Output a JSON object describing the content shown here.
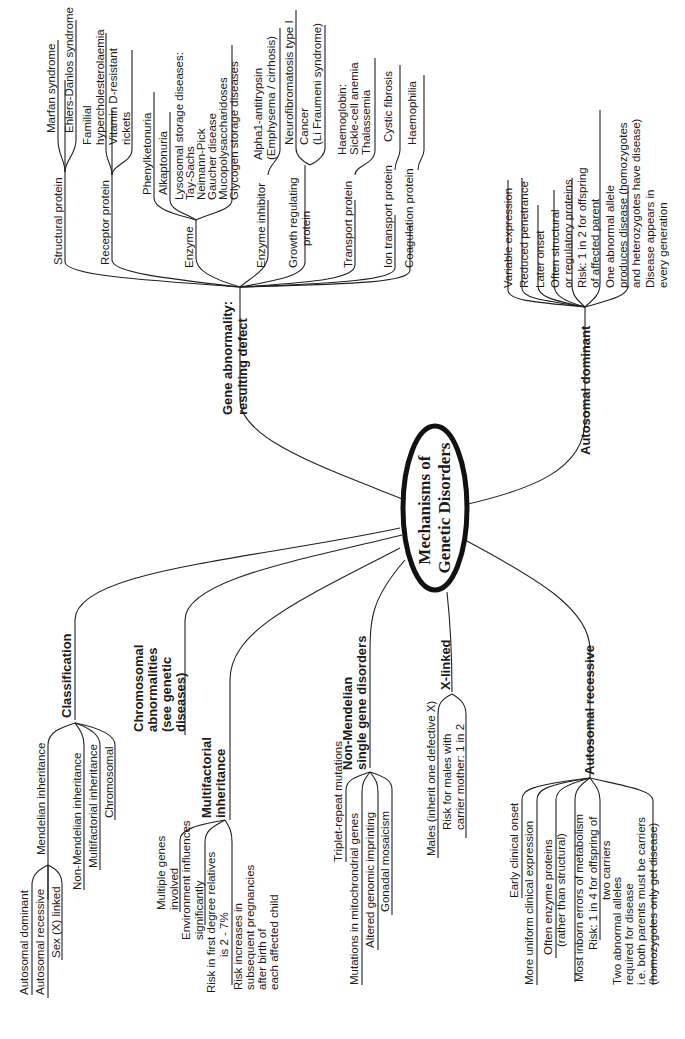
{
  "center": {
    "lines": [
      "Mechanisms of",
      "Genetic Disorders"
    ]
  },
  "branches": {
    "gene_abnormality": {
      "title": [
        "Gene abnormality:",
        "resulting defect"
      ],
      "children": [
        {
          "label": [
            "Structural protein"
          ],
          "items": [
            [
              "Marfan syndrome"
            ],
            [
              "Ehlers-Danlos syndrome"
            ]
          ]
        },
        {
          "label": [
            "Receptor protein"
          ],
          "items": [
            [
              "Familial",
              "hypercholesterolaemia"
            ],
            [
              "Vitamin D-resistant",
              "rickets"
            ]
          ]
        },
        {
          "label": [
            "Enzyme"
          ],
          "items": [
            [
              "Phenylketonuria"
            ],
            [
              "Alkaptonuria"
            ],
            [
              "Lysosomal storage diseases:",
              "Tay-Sachs",
              "Neimann-Pick",
              "Gaucher disease",
              "Mucopolysaccharidoses",
              "Glycogen storage diseases"
            ]
          ]
        },
        {
          "label": [
            "Enzyme inhibitor"
          ],
          "items": [
            [
              "Alpha1-antitrypsin",
              "(Emphysema / cirrhosis)"
            ]
          ]
        },
        {
          "label": [
            "Growth regulating",
            "protein"
          ],
          "items": [
            [
              "Neurofibromatosis type I"
            ],
            [
              "Cancer",
              "(Li Fraumeni syndrome)"
            ]
          ]
        },
        {
          "label": [
            "Transport protein"
          ],
          "items": [
            [
              "Haemoglobin:",
              "Sickle-cell anemia",
              "Thalassemia"
            ]
          ]
        },
        {
          "label": [
            "Ion transport protein"
          ],
          "items": [
            [
              "Cystic fibrosis"
            ]
          ]
        },
        {
          "label": [
            "Coagulation protein"
          ],
          "items": [
            [
              "Haemophilia"
            ]
          ]
        }
      ]
    },
    "autosomal_dominant": {
      "title": [
        "Autosomal dominant"
      ],
      "items": [
        [
          "Variable expression"
        ],
        [
          "Reduced penetrance"
        ],
        [
          "Later onset"
        ],
        [
          "Often structural",
          "or regulatory proteins"
        ],
        [
          "Risk: 1 in 2 for offspring",
          "of affected parent"
        ],
        [
          "One abnormal allele",
          "produces disease (homozygotes",
          "and heterozygotes have disease)"
        ],
        [
          "Disease appears in",
          "every generation"
        ]
      ]
    },
    "classification": {
      "title": [
        "Classification"
      ],
      "children": [
        {
          "label": [
            "Mendelian inheritance"
          ],
          "items": [
            [
              "Autosomal dominant"
            ],
            [
              "Autosomal recessive"
            ],
            [
              "Sex (X) linked"
            ]
          ]
        },
        {
          "label": [
            "Non-Mendelian inheritance"
          ],
          "items": []
        },
        {
          "label": [
            "Multifactorial inheritance"
          ],
          "items": []
        },
        {
          "label": [
            "Chromosomal"
          ],
          "items": []
        }
      ]
    },
    "chromosomal": {
      "title": [
        "Chromosomal",
        "abnormalities",
        "(see  genetic",
        "diseases)"
      ]
    },
    "multifactorial": {
      "title": [
        "Multifactorial",
        "inheritance"
      ],
      "items": [
        [
          "Multiple genes",
          "involved"
        ],
        [
          "Environment influences",
          "significantly"
        ],
        [
          "Risk in first degree relatives",
          "is 2 - 7%"
        ],
        [
          "Risk increases in",
          "subsequent pregnancies",
          "after birth of",
          "each affected child"
        ]
      ]
    },
    "non_mendelian": {
      "title": [
        "Non-Mendelian",
        "single gene disorders"
      ],
      "items": [
        [
          "Triplet-repeat mutations"
        ],
        [
          "Mutations in mitochrondrial genes"
        ],
        [
          "Altered genomic imprinting"
        ],
        [
          "Gonadal mosaicism"
        ]
      ]
    },
    "x_linked": {
      "title": [
        "X-linked"
      ],
      "items": [
        [
          "Males (inherit one defective X)"
        ],
        [
          "Risk for males with",
          "carrier mother: 1 in 2"
        ]
      ]
    },
    "autosomal_recessive": {
      "title": [
        "Autosomal recessive"
      ],
      "items": [
        [
          "Early clinical onset"
        ],
        [
          "More uniform clinical expression"
        ],
        [
          "Often enzyme proteins",
          "(rather than structural)"
        ],
        [
          "Most inborn errors of metabolism"
        ],
        [
          "Risk: 1 in 4 for offspring of",
          "two carriers"
        ],
        [
          "Two abnormal alleles",
          "required for disease",
          "i.e. both parents must be carriers",
          "(homozygotes only get disease)"
        ]
      ]
    }
  }
}
